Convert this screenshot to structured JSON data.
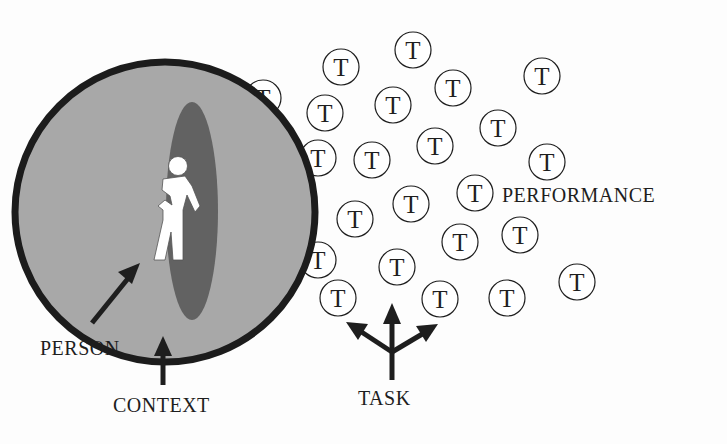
{
  "diagram": {
    "colors": {
      "background": "#fdfdfd",
      "context_fill": "#a8a8a8",
      "context_stroke": "#1c1c1c",
      "person_ellipse": "#626262",
      "figure": "#ffffff",
      "ink": "#1e1e1e"
    },
    "labels": {
      "person": "PERSON",
      "context": "CONTEXT",
      "task": "TASK",
      "performance": "PERFORMANCE"
    },
    "task_symbol": "T",
    "task_circles": [
      {
        "cx": 263,
        "cy": 98
      },
      {
        "cx": 341,
        "cy": 67
      },
      {
        "cx": 413,
        "cy": 50
      },
      {
        "cx": 453,
        "cy": 88
      },
      {
        "cx": 542,
        "cy": 76
      },
      {
        "cx": 325,
        "cy": 113
      },
      {
        "cx": 393,
        "cy": 105
      },
      {
        "cx": 498,
        "cy": 128
      },
      {
        "cx": 318,
        "cy": 158
      },
      {
        "cx": 372,
        "cy": 160
      },
      {
        "cx": 435,
        "cy": 146
      },
      {
        "cx": 547,
        "cy": 162
      },
      {
        "cx": 475,
        "cy": 193
      },
      {
        "cx": 411,
        "cy": 204
      },
      {
        "cx": 355,
        "cy": 219
      },
      {
        "cx": 520,
        "cy": 235
      },
      {
        "cx": 460,
        "cy": 242
      },
      {
        "cx": 318,
        "cy": 260
      },
      {
        "cx": 397,
        "cy": 267
      },
      {
        "cx": 577,
        "cy": 282
      },
      {
        "cx": 338,
        "cy": 298
      },
      {
        "cx": 440,
        "cy": 299
      },
      {
        "cx": 507,
        "cy": 298
      }
    ]
  }
}
